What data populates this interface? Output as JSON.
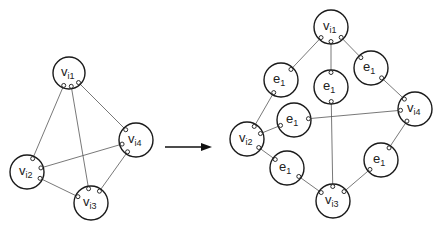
{
  "diagram": {
    "title": "",
    "colors": {
      "stroke": "#1a1a1a",
      "edge": "#555555",
      "background": "#ffffff"
    },
    "left_graph": {
      "nodes": [
        {
          "id": "L1",
          "base": "v",
          "sub": "i1",
          "x": 69,
          "y": 73,
          "r": 16
        },
        {
          "id": "L2",
          "base": "v",
          "sub": "i2",
          "x": 27,
          "y": 172,
          "r": 17
        },
        {
          "id": "L3",
          "base": "v",
          "sub": "i3",
          "x": 91,
          "y": 203,
          "r": 17
        },
        {
          "id": "L4",
          "base": "v",
          "sub": "i4",
          "x": 136,
          "y": 140,
          "r": 17
        }
      ],
      "edges": [
        [
          "L1",
          "L2"
        ],
        [
          "L1",
          "L3"
        ],
        [
          "L1",
          "L4"
        ],
        [
          "L2",
          "L4"
        ],
        [
          "L2",
          "L3"
        ],
        [
          "L3",
          "L4"
        ]
      ]
    },
    "arrow": {
      "x1": 165,
      "y1": 147,
      "x2": 212,
      "y2": 147
    },
    "right_graph": {
      "nodes": [
        {
          "id": "R1",
          "base": "v",
          "sub": "i1",
          "x": 331,
          "y": 27,
          "r": 17
        },
        {
          "id": "R2",
          "base": "v",
          "sub": "i2",
          "x": 247,
          "y": 139,
          "r": 17
        },
        {
          "id": "R3",
          "base": "v",
          "sub": "i3",
          "x": 333,
          "y": 201,
          "r": 17
        },
        {
          "id": "R4",
          "base": "v",
          "sub": "i4",
          "x": 415,
          "y": 109,
          "r": 17
        },
        {
          "id": "E12",
          "base": "e",
          "sub": "1",
          "x": 281,
          "y": 80,
          "r": 17
        },
        {
          "id": "E13",
          "base": "e",
          "sub": "1",
          "x": 331,
          "y": 87,
          "r": 17
        },
        {
          "id": "E14",
          "base": "e",
          "sub": "1",
          "x": 371,
          "y": 68,
          "r": 17
        },
        {
          "id": "E24",
          "base": "e",
          "sub": "1",
          "x": 294,
          "y": 120,
          "r": 17
        },
        {
          "id": "E23",
          "base": "e",
          "sub": "1",
          "x": 287,
          "y": 168,
          "r": 17
        },
        {
          "id": "E34",
          "base": "e",
          "sub": "1",
          "x": 381,
          "y": 160,
          "r": 17
        }
      ],
      "edges": [
        [
          "R1",
          "E12"
        ],
        [
          "E12",
          "R2"
        ],
        [
          "R1",
          "E13"
        ],
        [
          "E13",
          "R3"
        ],
        [
          "R1",
          "E14"
        ],
        [
          "E14",
          "R4"
        ],
        [
          "R2",
          "E24"
        ],
        [
          "E24",
          "R4"
        ],
        [
          "R2",
          "E23"
        ],
        [
          "E23",
          "R3"
        ],
        [
          "R3",
          "E34"
        ],
        [
          "E34",
          "R4"
        ]
      ]
    }
  }
}
